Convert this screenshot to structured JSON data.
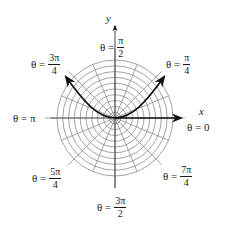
{
  "diagram": {
    "type": "polar-grid",
    "center": {
      "x": 115,
      "y": 118
    },
    "ring_count": 10,
    "outer_radius": 58,
    "radial_line_count": 16,
    "colors": {
      "grid": "#8c8c8c",
      "curve": "#111111",
      "axis": "#111111",
      "text": "#1a1a1a"
    },
    "axes": {
      "x_label": "x",
      "y_label": "y"
    },
    "curve": {
      "description": "U-shaped curve through origin with arrowheads at both ends",
      "start": {
        "x": 66,
        "y": 77
      },
      "end": {
        "x": 164,
        "y": 77
      }
    },
    "angle_labels": [
      {
        "id": "0",
        "prefix": "θ =",
        "value": "0"
      },
      {
        "id": "pi_4",
        "prefix": "θ =",
        "num": "π",
        "den": "4"
      },
      {
        "id": "pi_2",
        "prefix": "θ =",
        "num": "π",
        "den": "2"
      },
      {
        "id": "3pi_4",
        "prefix": "θ =",
        "num": "3π",
        "den": "4"
      },
      {
        "id": "pi",
        "prefix": "θ =",
        "value": "π"
      },
      {
        "id": "5pi_4",
        "prefix": "θ =",
        "num": "5π",
        "den": "4"
      },
      {
        "id": "3pi_2",
        "prefix": "θ =",
        "num": "3π",
        "den": "2"
      },
      {
        "id": "7pi_4",
        "prefix": "θ =",
        "num": "7π",
        "den": "4"
      }
    ]
  }
}
